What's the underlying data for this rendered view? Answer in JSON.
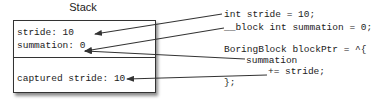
{
  "diagram": {
    "title": "Stack",
    "stack_box": {
      "top_section": [
        "stride: 10",
        "summation: 0"
      ],
      "bottom_section": [
        "captured stride: 10"
      ]
    },
    "code_lines": [
      "int stride = 10;",
      "__block int summation = 0;",
      "BoringBlock blockPtr = ^{",
      "summation",
      "+= stride;",
      "};"
    ],
    "arrows": [
      {
        "from": "int stride = 10;",
        "to": "stride: 10"
      },
      {
        "from": "__block int summation = 0;",
        "to": "summation: 0"
      },
      {
        "from": "summation",
        "to": "summation: 0"
      },
      {
        "from": "+= stride;",
        "to": "captured stride: 10"
      }
    ],
    "colors": {
      "line": "#333333",
      "text": "#222222",
      "background": "#ffffff"
    }
  }
}
